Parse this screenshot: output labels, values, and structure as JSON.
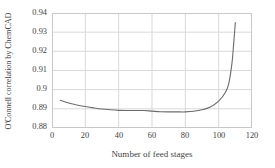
{
  "chart_data": {
    "type": "line",
    "title": "",
    "xlabel": "Number of feed stages",
    "ylabel": "O'Connell correlation by ChemCAD",
    "xlim": [
      0,
      120
    ],
    "ylim": [
      0.88,
      0.94
    ],
    "xticks": [
      0,
      20,
      40,
      60,
      80,
      100,
      120
    ],
    "xtick_labels": [
      "0",
      "20",
      "40",
      "60",
      "80",
      "100",
      "120"
    ],
    "yticks": [
      0.88,
      0.89,
      0.9,
      0.91,
      0.92,
      0.93,
      0.94
    ],
    "ytick_labels": [
      "0.88",
      "0.89",
      "0.9",
      "0.91",
      "0.92",
      "0.93",
      "0.94"
    ],
    "grid": true,
    "legend": "none",
    "line_color": "#6b6b6b",
    "grid_color": "#d9d9d9",
    "frame_color": "#c8c8c8",
    "series": [
      {
        "name": "O'Connell correlation by ChemCAD",
        "x": [
          5,
          10,
          15,
          20,
          25,
          30,
          35,
          40,
          45,
          50,
          55,
          60,
          65,
          70,
          75,
          80,
          85,
          90,
          95,
          100,
          104,
          106,
          108,
          109,
          110
        ],
        "y": [
          0.8945,
          0.893,
          0.892,
          0.8912,
          0.8905,
          0.8899,
          0.8895,
          0.8892,
          0.8891,
          0.8891,
          0.8891,
          0.8888,
          0.8885,
          0.8884,
          0.8884,
          0.8884,
          0.8887,
          0.8895,
          0.891,
          0.894,
          0.8985,
          0.903,
          0.914,
          0.924,
          0.935
        ]
      }
    ]
  }
}
